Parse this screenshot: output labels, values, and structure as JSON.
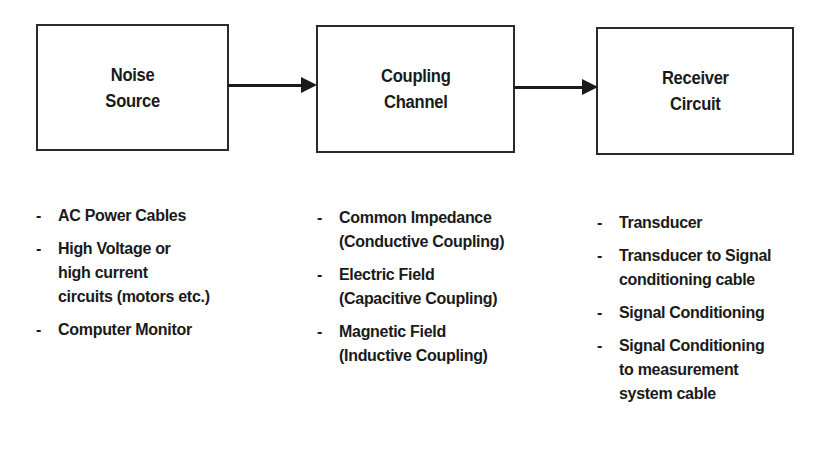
{
  "diagram": {
    "type": "block-flow",
    "blocks": [
      {
        "id": "noise_source",
        "title": "Noise\nSource"
      },
      {
        "id": "coupling_channel",
        "title": "Coupling\nChannel"
      },
      {
        "id": "receiver_circuit",
        "title": "Receiver\nCircuit"
      }
    ],
    "connections": [
      {
        "from": "noise_source",
        "to": "coupling_channel"
      },
      {
        "from": "coupling_channel",
        "to": "receiver_circuit"
      }
    ],
    "bullet": "-",
    "lists": {
      "noise_source": [
        "AC Power Cables",
        "High Voltage or\nhigh current\ncircuits (motors etc.)",
        "Computer Monitor"
      ],
      "coupling_channel": [
        "Common Impedance\n(Conductive Coupling)",
        "Electric Field\n(Capacitive Coupling)",
        "Magnetic Field\n(Inductive Coupling)"
      ],
      "receiver_circuit": [
        "Transducer",
        "Transducer to Signal\nconditioning cable",
        "Signal Conditioning",
        "Signal Conditioning\nto measurement\nsystem cable"
      ]
    }
  }
}
